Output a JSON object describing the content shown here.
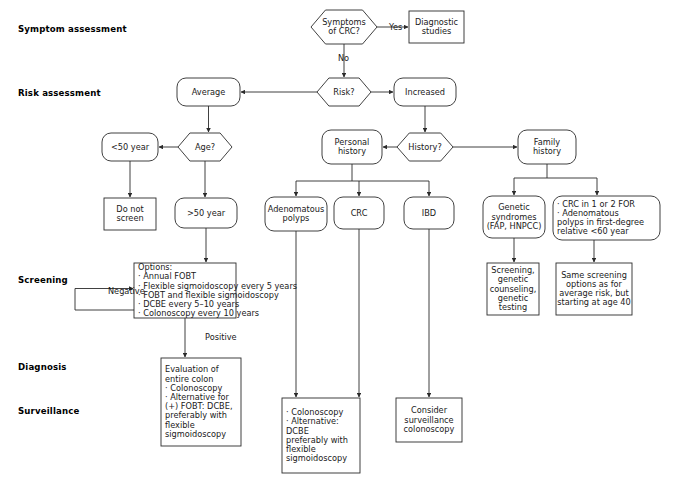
{
  "figure": {
    "type": "flowchart",
    "orientation": "top-down",
    "shape_legend": {
      "hexagon": "decision",
      "rounded-rect": "state / category",
      "rect": "action / recommendation"
    }
  },
  "stage_labels": [
    {
      "id": "symptom",
      "text": "Symptom assessment",
      "x": 18,
      "y": 24
    },
    {
      "id": "risk",
      "text": "Risk assessment",
      "x": 18,
      "y": 88
    },
    {
      "id": "screening",
      "text": "Screening",
      "x": 18,
      "y": 275
    },
    {
      "id": "diagnosis",
      "text": "Diagnosis",
      "x": 18,
      "y": 362
    },
    {
      "id": "surveillance",
      "text": "Surveillance",
      "x": 18,
      "y": 406
    }
  ],
  "nodes": [
    {
      "id": "symptoms-crc",
      "shape": "hexagon",
      "x": 311,
      "y": 10,
      "w": 66,
      "h": 34,
      "lines": [
        "Symptoms",
        "of CRC?"
      ]
    },
    {
      "id": "diagnostic-studies",
      "shape": "rect",
      "x": 409,
      "y": 11,
      "w": 55,
      "h": 32,
      "lines": [
        "Diagnostic",
        "studies"
      ]
    },
    {
      "id": "risk-decision",
      "shape": "hexagon",
      "x": 317,
      "y": 78,
      "w": 54,
      "h": 28,
      "lines": [
        "Risk?"
      ]
    },
    {
      "id": "average",
      "shape": "rounded",
      "x": 177,
      "y": 78,
      "w": 63,
      "h": 28,
      "lines": [
        "Average"
      ]
    },
    {
      "id": "increased",
      "shape": "rounded",
      "x": 394,
      "y": 78,
      "w": 62,
      "h": 28,
      "lines": [
        "Increased"
      ]
    },
    {
      "id": "age-decision",
      "shape": "hexagon",
      "x": 178,
      "y": 133,
      "w": 54,
      "h": 28,
      "lines": [
        "Age?"
      ]
    },
    {
      "id": "under-50",
      "shape": "rounded",
      "x": 102,
      "y": 133,
      "w": 56,
      "h": 28,
      "lines": [
        "<50 year"
      ]
    },
    {
      "id": "personal-history",
      "shape": "rounded",
      "x": 322,
      "y": 130,
      "w": 60,
      "h": 34,
      "lines": [
        "Personal",
        "history"
      ]
    },
    {
      "id": "history-decision",
      "shape": "hexagon",
      "x": 397,
      "y": 133,
      "w": 56,
      "h": 28,
      "lines": [
        "History?"
      ]
    },
    {
      "id": "family-history",
      "shape": "rounded",
      "x": 518,
      "y": 130,
      "w": 58,
      "h": 34,
      "lines": [
        "Family",
        "history"
      ]
    },
    {
      "id": "do-not-screen",
      "shape": "rect",
      "x": 104,
      "y": 198,
      "w": 52,
      "h": 32,
      "lines": [
        "Do not",
        "screen"
      ]
    },
    {
      "id": "over-50",
      "shape": "rounded",
      "x": 175,
      "y": 198,
      "w": 62,
      "h": 30,
      "lines": [
        ">50 year"
      ]
    },
    {
      "id": "adenomatous-polyps",
      "shape": "rounded",
      "x": 265,
      "y": 197,
      "w": 62,
      "h": 34,
      "lines": [
        "Adenomatous",
        "polyps"
      ]
    },
    {
      "id": "crc",
      "shape": "rounded",
      "x": 334,
      "y": 197,
      "w": 50,
      "h": 32,
      "lines": [
        "CRC"
      ]
    },
    {
      "id": "ibd",
      "shape": "rounded",
      "x": 404,
      "y": 197,
      "w": 50,
      "h": 32,
      "lines": [
        "IBD"
      ]
    },
    {
      "id": "genetic-syndromes",
      "shape": "rounded",
      "x": 483,
      "y": 196,
      "w": 62,
      "h": 42,
      "lines": [
        "Genetic",
        "syndromes",
        "(FAP, HNPCC)"
      ]
    },
    {
      "id": "family-risk-criteria",
      "shape": "rounded-left",
      "x": 553,
      "y": 196,
      "w": 107,
      "h": 44,
      "lines": [
        "· CRC in 1 or 2 FOR",
        "· Adenomatous",
        "  polyps in first-degree",
        "  relative <60 year"
      ]
    },
    {
      "id": "screening-options",
      "shape": "rect-left",
      "x": 134,
      "y": 263,
      "w": 102,
      "h": 55,
      "lines": [
        "Options:",
        "· Annual FOBT",
        "· Flexible sigmoidoscopy every 5 years",
        "· FOBT and flexible sigmoidoscopy",
        "· DCBE every 5–10 years",
        "· Colonoscopy every 10 years"
      ]
    },
    {
      "id": "genetic-counseling",
      "shape": "rect",
      "x": 487,
      "y": 263,
      "w": 52,
      "h": 52,
      "lines": [
        "Screening,",
        "genetic",
        "counseling,",
        "genetic",
        "testing"
      ]
    },
    {
      "id": "same-screening",
      "shape": "rect",
      "x": 556,
      "y": 263,
      "w": 76,
      "h": 52,
      "lines": [
        "Same screening",
        "options as for",
        "average risk, but",
        "starting at age 40"
      ]
    },
    {
      "id": "evaluation-colon",
      "shape": "rect-left",
      "x": 161,
      "y": 358,
      "w": 80,
      "h": 88,
      "lines": [
        "Evaluation of",
        "entire colon",
        "· Colonoscopy",
        "· Alternative for",
        "  (+) FOBT: DCBE,",
        "  preferably with",
        "  flexible",
        "  sigmoidoscopy"
      ]
    },
    {
      "id": "surveillance-colonoscopy-crc",
      "shape": "rect-left",
      "x": 282,
      "y": 398,
      "w": 78,
      "h": 75,
      "lines": [
        "· Colonoscopy",
        "· Alternative:",
        "  DCBE",
        "  preferably with",
        "  flexible",
        "  sigmoidoscopy"
      ]
    },
    {
      "id": "consider-surveillance",
      "shape": "rect",
      "x": 396,
      "y": 398,
      "w": 66,
      "h": 44,
      "lines": [
        "Consider",
        "surveillance",
        "colonoscopy"
      ]
    }
  ],
  "edge_labels": [
    {
      "id": "yes-label",
      "text": "Yes",
      "x": 389,
      "y": 30
    },
    {
      "id": "no-label",
      "text": "No",
      "x": 338,
      "y": 61
    },
    {
      "id": "negative-label",
      "text": "Negative",
      "x": 108,
      "y": 294
    },
    {
      "id": "positive-label",
      "text": "Positive",
      "x": 205,
      "y": 340
    }
  ],
  "edges": [
    {
      "from": "symptoms-crc",
      "to": "diagnostic-studies",
      "label": "Yes"
    },
    {
      "from": "symptoms-crc",
      "to": "risk-decision",
      "label": "No"
    },
    {
      "from": "risk-decision",
      "to": "average",
      "label": ""
    },
    {
      "from": "risk-decision",
      "to": "increased",
      "label": ""
    },
    {
      "from": "average",
      "to": "age-decision",
      "label": ""
    },
    {
      "from": "age-decision",
      "to": "under-50",
      "label": ""
    },
    {
      "from": "age-decision",
      "to": "over-50",
      "label": ""
    },
    {
      "from": "under-50",
      "to": "do-not-screen",
      "label": ""
    },
    {
      "from": "increased",
      "to": "history-decision",
      "label": ""
    },
    {
      "from": "history-decision",
      "to": "personal-history",
      "label": ""
    },
    {
      "from": "history-decision",
      "to": "family-history",
      "label": ""
    },
    {
      "from": "personal-history",
      "to": "adenomatous-polyps",
      "label": ""
    },
    {
      "from": "personal-history",
      "to": "crc",
      "label": ""
    },
    {
      "from": "personal-history",
      "to": "ibd",
      "label": ""
    },
    {
      "from": "family-history",
      "to": "genetic-syndromes",
      "label": ""
    },
    {
      "from": "family-history",
      "to": "family-risk-criteria",
      "label": ""
    },
    {
      "from": "over-50",
      "to": "screening-options",
      "label": ""
    },
    {
      "from": "screening-options",
      "to": "screening-options",
      "label": "Negative"
    },
    {
      "from": "screening-options",
      "to": "evaluation-colon",
      "label": "Positive"
    },
    {
      "from": "genetic-syndromes",
      "to": "genetic-counseling",
      "label": ""
    },
    {
      "from": "family-risk-criteria",
      "to": "same-screening",
      "label": ""
    },
    {
      "from": "adenomatous-polyps",
      "to": "surveillance-colonoscopy-crc",
      "label": ""
    },
    {
      "from": "crc",
      "to": "surveillance-colonoscopy-crc",
      "label": ""
    },
    {
      "from": "ibd",
      "to": "consider-surveillance",
      "label": ""
    }
  ],
  "colors": {
    "background": "#ffffff",
    "stroke": "#2b2b2b",
    "text": "#1a1a1a",
    "label_text": "#000000"
  }
}
